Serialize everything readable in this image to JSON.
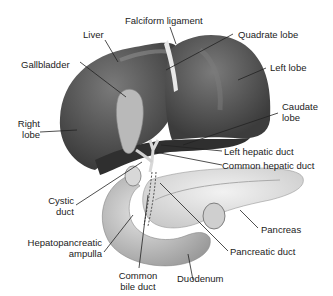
{
  "diagram": {
    "labels": {
      "liver": "Liver",
      "falciform": "Falciform ligament",
      "quadrate": "Quadrate lobe",
      "gallbladder": "Gallbladder",
      "left_lobe": "Left lobe",
      "right_lobe_1": "Right",
      "right_lobe_2": "lobe",
      "caudate_1": "Caudate",
      "caudate_2": "lobe",
      "left_hepatic": "Left hepatic duct",
      "common_hepatic": "Common hepatic duct",
      "cystic_1": "Cystic",
      "cystic_2": "duct",
      "pancreas": "Pancreas",
      "hepato_1": "Hepatopancreatic",
      "hepato_2": "ampulla",
      "pancreatic_duct": "Pancreatic duct",
      "common_bile_1": "Common",
      "common_bile_2": "bile duct",
      "duodenum": "Duodenum"
    },
    "colors": {
      "liver": "#4a4a4a",
      "liver_highlight": "#6e6e6e",
      "gallbladder": "#b5b5b5",
      "pancreas": "#e2e2e2",
      "duodenum": "#c4c4c4",
      "leader_line": "#222222"
    }
  }
}
